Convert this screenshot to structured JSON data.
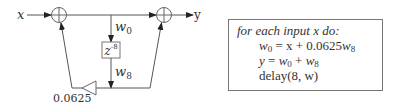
{
  "diagram": {
    "input_label": "x",
    "output_label": "y",
    "node_top_label": "w",
    "node_top_sub": "0",
    "delay_base": "z",
    "delay_exp": "-8",
    "node_bottom_label": "w",
    "node_bottom_sub": "8",
    "gain_label": "0.0625",
    "adders": [
      "adder-input",
      "adder-output"
    ]
  },
  "algorithm": {
    "header": "for each input x do:",
    "lines": [
      {
        "lhs": "w",
        "lhs_sub": "0",
        "rhs": " = x + 0.0625",
        "rhs_var": "w",
        "rhs_sub": "8"
      },
      {
        "lhs": "y",
        "rhs": " = ",
        "a": "w",
        "a_sub": "0",
        "op": " + ",
        "b": "w",
        "b_sub": "8"
      },
      {
        "text": "delay(8, w)"
      }
    ]
  },
  "colors": {
    "stroke": "#555555",
    "text": "#333333",
    "box_border": "#777777"
  }
}
